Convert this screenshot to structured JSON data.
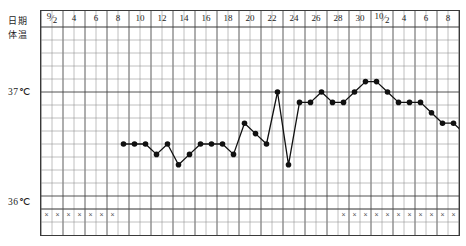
{
  "axis": {
    "row_label_date": "日期",
    "row_label_temp": "体温",
    "y_high_label": "37℃",
    "y_low_label": "36℃"
  },
  "chart_data": {
    "type": "line",
    "title": "",
    "subtitle": "",
    "xlabel": "日期",
    "ylabel": "体温",
    "ylim": [
      35.8,
      37.3
    ],
    "y_ticks": [
      36,
      37
    ],
    "y_tick_labels": [
      "36℃",
      "37℃"
    ],
    "grid": true,
    "legend": "none",
    "x_header_labels": [
      {
        "text": "9/2",
        "type": "fraction",
        "numerator": "9",
        "denominator": "2",
        "day_index": 0
      },
      {
        "text": "4",
        "type": "plain",
        "day_index": 2
      },
      {
        "text": "6",
        "type": "plain",
        "day_index": 4
      },
      {
        "text": "8",
        "type": "plain",
        "day_index": 6
      },
      {
        "text": "10",
        "type": "plain",
        "day_index": 8
      },
      {
        "text": "12",
        "type": "plain",
        "day_index": 10
      },
      {
        "text": "14",
        "type": "plain",
        "day_index": 12
      },
      {
        "text": "16",
        "type": "plain",
        "day_index": 14
      },
      {
        "text": "18",
        "type": "plain",
        "day_index": 16
      },
      {
        "text": "20",
        "type": "plain",
        "day_index": 18
      },
      {
        "text": "22",
        "type": "plain",
        "day_index": 20
      },
      {
        "text": "24",
        "type": "plain",
        "day_index": 22
      },
      {
        "text": "26",
        "type": "plain",
        "day_index": 24
      },
      {
        "text": "28",
        "type": "plain",
        "day_index": 26
      },
      {
        "text": "30",
        "type": "plain",
        "day_index": 28
      },
      {
        "text": "10/2",
        "type": "fraction",
        "numerator": "10",
        "denominator": "2",
        "day_index": 30
      },
      {
        "text": "4",
        "type": "plain",
        "day_index": 32
      },
      {
        "text": "6",
        "type": "plain",
        "day_index": 34
      },
      {
        "text": "8",
        "type": "plain",
        "day_index": 36
      }
    ],
    "x": [
      7,
      8,
      9,
      10,
      11,
      12,
      13,
      14,
      15,
      16,
      17,
      18,
      19,
      20,
      21,
      22,
      23,
      24,
      25,
      26,
      27,
      28,
      29,
      30,
      31,
      32,
      33,
      34,
      35,
      36,
      37
    ],
    "values": [
      36.5,
      36.5,
      36.5,
      36.4,
      36.5,
      36.3,
      36.4,
      36.5,
      36.5,
      36.5,
      36.4,
      36.7,
      36.6,
      36.5,
      37.0,
      36.3,
      36.9,
      36.9,
      37.0,
      36.9,
      36.9,
      37.0,
      37.1,
      37.1,
      37.0,
      36.9,
      36.9,
      36.9,
      36.8,
      36.7,
      36.7
    ],
    "values_tail": [
      36.6,
      36.5,
      36.5
    ],
    "point_marker": "filled-circle",
    "line_color": "#111111",
    "marker_color": "#111111",
    "menstruation_marker": "×",
    "menstruation_days_left": [
      0,
      1,
      2,
      3,
      4,
      5,
      6
    ],
    "menstruation_days_right": [
      27,
      28,
      29,
      30,
      31,
      32,
      33,
      34,
      35,
      36,
      37
    ],
    "columns_total": 38,
    "rows_total": 16,
    "header_rows": 1
  }
}
